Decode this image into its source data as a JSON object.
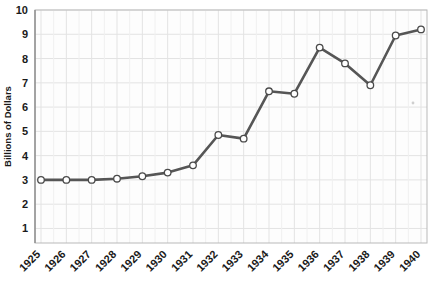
{
  "chart_data": {
    "type": "line",
    "title": "",
    "subtitle": "",
    "xlabel": "",
    "ylabel": "Billions of Dollars",
    "categories": [
      "1925",
      "1926",
      "1927",
      "1928",
      "1929",
      "1930",
      "1931",
      "1932",
      "1933",
      "1934",
      "1935",
      "1936",
      "1937",
      "1938",
      "1939",
      "1940"
    ],
    "values": [
      3.0,
      3.0,
      3.0,
      3.05,
      3.15,
      3.3,
      3.6,
      4.85,
      4.7,
      6.65,
      6.55,
      8.45,
      7.8,
      6.9,
      8.95,
      9.2
    ],
    "series": [
      {
        "name": "Billions of Dollars",
        "values": [
          3.0,
          3.0,
          3.0,
          3.05,
          3.15,
          3.3,
          3.6,
          4.85,
          4.7,
          6.65,
          6.55,
          8.45,
          7.8,
          6.9,
          8.95,
          9.2
        ]
      }
    ],
    "ylim": [
      0.4,
      10.0
    ],
    "xlim": [
      "1925",
      "1940"
    ],
    "ytick_labels": [
      "1",
      "2",
      "3",
      "4",
      "5",
      "6",
      "7",
      "8",
      "9",
      "10"
    ],
    "ytick_values": [
      1,
      2,
      3,
      4,
      5,
      6,
      7,
      8,
      9,
      10
    ],
    "xtick_labels": [
      "1925",
      "1926",
      "1927",
      "1928",
      "1929",
      "1930",
      "1931",
      "1932",
      "1933",
      "1934",
      "1935",
      "1936",
      "1937",
      "1938",
      "1939",
      "1940"
    ],
    "grid": true,
    "legend": false,
    "legend_position": "none",
    "marker": "circle-open",
    "line_color": "#565656",
    "marker_fill": "#ffffff",
    "marker_edge": "#4a4a4a",
    "grid_color": "#e3e3e3",
    "plot_background": "#fdfdfd",
    "figure_background": "#ffffff",
    "xtick_rotation": -45
  }
}
